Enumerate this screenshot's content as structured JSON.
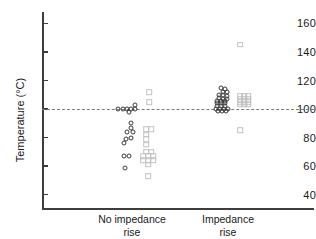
{
  "chart_data": {
    "type": "scatter",
    "title": "",
    "xlabel": "",
    "ylabel": "Temperature (°C)",
    "ylim": [
      30,
      168
    ],
    "yticks": [
      40,
      60,
      80,
      100,
      120,
      140,
      160
    ],
    "ytick_labels": [
      "40",
      "60",
      "80",
      "100",
      "120",
      "140",
      "160"
    ],
    "grid": false,
    "legend": "none",
    "categories": [
      "No impedance rise",
      "Impedance rise"
    ],
    "category_labels": [
      {
        "line1": "No impedance",
        "line2": "rise"
      },
      {
        "line1": "Impedance",
        "line2": "rise"
      }
    ],
    "annotations": [
      {
        "type": "hline",
        "y": 100,
        "style": "dashed",
        "color": "#7d7d7d",
        "label": ""
      }
    ],
    "series": [
      {
        "name": "No impedance rise — circles",
        "marker": "circle",
        "color": "#3a3a3a",
        "group": 0,
        "sub_column": 0,
        "points": [
          {
            "x_offset": -14,
            "y": 100
          },
          {
            "x_offset": -9,
            "y": 100
          },
          {
            "x_offset": -5,
            "y": 100
          },
          {
            "x_offset": -1,
            "y": 100
          },
          {
            "x_offset": 3,
            "y": 100
          },
          {
            "x_offset": 3,
            "y": 103
          },
          {
            "x_offset": -3,
            "y": 98
          },
          {
            "x_offset": -1,
            "y": 90
          },
          {
            "x_offset": -1,
            "y": 87
          },
          {
            "x_offset": -5,
            "y": 84
          },
          {
            "x_offset": 1,
            "y": 84
          },
          {
            "x_offset": -6,
            "y": 79
          },
          {
            "x_offset": -1,
            "y": 80
          },
          {
            "x_offset": -8,
            "y": 76
          },
          {
            "x_offset": -8,
            "y": 67
          },
          {
            "x_offset": -3,
            "y": 67
          },
          {
            "x_offset": -7,
            "y": 59
          }
        ]
      },
      {
        "name": "No impedance rise — squares",
        "marker": "square",
        "color": "#c2c2c2",
        "group": 0,
        "sub_column": 1,
        "points": [
          {
            "x_offset": 17,
            "y": 112
          },
          {
            "x_offset": 17,
            "y": 105
          },
          {
            "x_offset": 14,
            "y": 86
          },
          {
            "x_offset": 19,
            "y": 86
          },
          {
            "x_offset": 14,
            "y": 82
          },
          {
            "x_offset": 14,
            "y": 79
          },
          {
            "x_offset": 14,
            "y": 75
          },
          {
            "x_offset": 14,
            "y": 70
          },
          {
            "x_offset": 19,
            "y": 70
          },
          {
            "x_offset": 11,
            "y": 67
          },
          {
            "x_offset": 16,
            "y": 67
          },
          {
            "x_offset": 21,
            "y": 67
          },
          {
            "x_offset": 11,
            "y": 64
          },
          {
            "x_offset": 16,
            "y": 64
          },
          {
            "x_offset": 21,
            "y": 64
          },
          {
            "x_offset": 16,
            "y": 61
          },
          {
            "x_offset": 16,
            "y": 53
          }
        ]
      },
      {
        "name": "Impedance rise — circles",
        "marker": "circle",
        "color": "#3a3a3a",
        "group": 1,
        "sub_column": 0,
        "points": [
          {
            "x_offset": -7,
            "y": 115
          },
          {
            "x_offset": -3,
            "y": 114
          },
          {
            "x_offset": -5,
            "y": 112
          },
          {
            "x_offset": -1,
            "y": 112
          },
          {
            "x_offset": -9,
            "y": 110
          },
          {
            "x_offset": -5,
            "y": 110
          },
          {
            "x_offset": -1,
            "y": 109
          },
          {
            "x_offset": -9,
            "y": 108
          },
          {
            "x_offset": -5,
            "y": 107
          },
          {
            "x_offset": -1,
            "y": 107
          },
          {
            "x_offset": -11,
            "y": 106
          },
          {
            "x_offset": -7,
            "y": 106
          },
          {
            "x_offset": -3,
            "y": 106
          },
          {
            "x_offset": -11,
            "y": 104
          },
          {
            "x_offset": -7,
            "y": 104
          },
          {
            "x_offset": -3,
            "y": 104
          },
          {
            "x_offset": -11,
            "y": 102
          },
          {
            "x_offset": -7,
            "y": 102
          },
          {
            "x_offset": -3,
            "y": 102
          },
          {
            "x_offset": -12,
            "y": 100
          },
          {
            "x_offset": -8,
            "y": 100
          },
          {
            "x_offset": -4,
            "y": 100
          },
          {
            "x_offset": 0,
            "y": 100
          },
          {
            "x_offset": -10,
            "y": 99
          },
          {
            "x_offset": -6,
            "y": 99
          },
          {
            "x_offset": -2,
            "y": 99
          }
        ]
      },
      {
        "name": "Impedance rise — squares",
        "marker": "square",
        "color": "#c2c2c2",
        "group": 1,
        "sub_column": 1,
        "points": [
          {
            "x_offset": 12,
            "y": 145
          },
          {
            "x_offset": 12,
            "y": 109
          },
          {
            "x_offset": 16,
            "y": 109
          },
          {
            "x_offset": 20,
            "y": 109
          },
          {
            "x_offset": 12,
            "y": 107
          },
          {
            "x_offset": 16,
            "y": 107
          },
          {
            "x_offset": 20,
            "y": 107
          },
          {
            "x_offset": 12,
            "y": 105
          },
          {
            "x_offset": 16,
            "y": 105
          },
          {
            "x_offset": 20,
            "y": 105
          },
          {
            "x_offset": 12,
            "y": 103
          },
          {
            "x_offset": 16,
            "y": 103
          },
          {
            "x_offset": 20,
            "y": 103
          },
          {
            "x_offset": 12,
            "y": 85
          }
        ]
      }
    ]
  }
}
